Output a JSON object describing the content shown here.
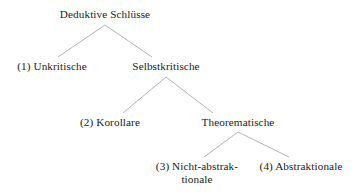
{
  "diagram": {
    "type": "tree",
    "title": "Deduktive Schlüsse",
    "language": "de",
    "background_color": "#ffffff",
    "text_color": "#1a1a1a",
    "edge_color": "#a9a9a9",
    "nodes": [
      {
        "id": "root",
        "label": "Deduktive Schlüsse",
        "level": 0,
        "x": 105,
        "y": 14
      },
      {
        "id": "unkritische",
        "label": "(1) Unkritische",
        "level": 1,
        "x": 52,
        "y": 66
      },
      {
        "id": "selbstkritische",
        "label": "Selbstkritische",
        "level": 1,
        "x": 166,
        "y": 66
      },
      {
        "id": "korollare",
        "label": "(2) Korollare",
        "level": 2,
        "x": 110,
        "y": 122
      },
      {
        "id": "theorematische",
        "label": "Theorematische",
        "level": 2,
        "x": 238,
        "y": 122
      },
      {
        "id": "nicht-abstraktionale",
        "label": "(3) Nicht-abstrak-",
        "label_line2": "tionale",
        "level": 3,
        "x": 197,
        "y": 166
      },
      {
        "id": "abstraktionale",
        "label": "(4) Abstraktionale",
        "level": 3,
        "x": 301,
        "y": 166
      }
    ],
    "edges": [
      {
        "from": "root",
        "to": "unkritische",
        "x1": 105,
        "y1": 25,
        "x2": 58,
        "y2": 57
      },
      {
        "from": "root",
        "to": "selbstkritische",
        "x1": 105,
        "y1": 25,
        "x2": 152,
        "y2": 57
      },
      {
        "from": "selbstkritische",
        "to": "korollare",
        "x1": 166,
        "y1": 77,
        "x2": 123,
        "y2": 113
      },
      {
        "from": "selbstkritische",
        "to": "theorematische",
        "x1": 166,
        "y1": 77,
        "x2": 213,
        "y2": 113
      },
      {
        "from": "theorematische",
        "to": "nicht-abstraktionale",
        "x1": 238,
        "y1": 132,
        "x2": 204,
        "y2": 157
      },
      {
        "from": "theorematische",
        "to": "abstraktionale",
        "x1": 238,
        "y1": 132,
        "x2": 289,
        "y2": 157
      }
    ]
  }
}
